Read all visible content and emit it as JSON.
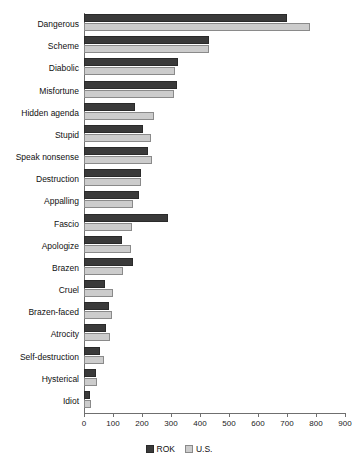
{
  "chart_data": {
    "type": "bar",
    "orientation": "horizontal",
    "title": "",
    "xlabel": "",
    "ylabel": "",
    "xlim": [
      0,
      900
    ],
    "xticks": [
      0,
      100,
      200,
      300,
      400,
      500,
      600,
      700,
      800,
      900
    ],
    "grid": false,
    "legend_position": "bottom-center",
    "categories": [
      "Dangerous",
      "Scheme",
      "Diabolic",
      "Misfortune",
      "Hidden agenda",
      "Stupid",
      "Speak nonsense",
      "Destruction",
      "Appalling",
      "Fascio",
      "Apologize",
      "Brazen",
      "Cruel",
      "Brazen-faced",
      "Atrocity",
      "Self-destruction",
      "Hysterical",
      "Idiot"
    ],
    "series": [
      {
        "name": "ROK",
        "color": "#3a3a3a",
        "values": [
          700,
          430,
          325,
          320,
          175,
          205,
          220,
          195,
          190,
          290,
          130,
          170,
          72,
          85,
          77,
          55,
          40,
          22
        ]
      },
      {
        "name": "U.S.",
        "color": "#cccccc",
        "values": [
          780,
          430,
          315,
          310,
          240,
          230,
          235,
          198,
          170,
          167,
          163,
          135,
          100,
          97,
          90,
          68,
          45,
          25
        ]
      }
    ]
  },
  "legend": {
    "items": [
      {
        "label": "ROK",
        "swatch": "dark-square-swatch"
      },
      {
        "label": "U.S.",
        "swatch": "light-square-swatch"
      }
    ]
  }
}
